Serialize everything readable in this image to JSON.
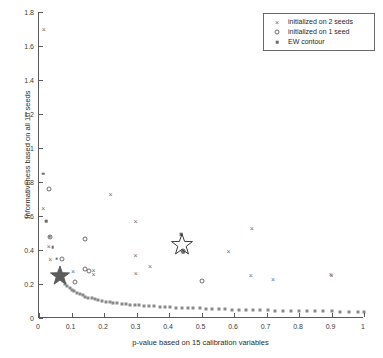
{
  "chart_data": {
    "type": "scatter",
    "title": "",
    "xlabel": "p-value based on 15 calibration variables",
    "ylabel": "Informativeness based on all 10 seeds",
    "xlim": [
      0,
      1
    ],
    "ylim": [
      0,
      1.8
    ],
    "grid": false,
    "legend_position": "top-right",
    "xticks": [
      "0",
      "0.1",
      "0.2",
      "0.3",
      "0.4",
      "0.5",
      "0.6",
      "0.7",
      "0.8",
      "0.9",
      "1"
    ],
    "xtick_values": [
      0,
      0.1,
      0.2,
      0.3,
      0.4,
      0.5,
      0.6,
      0.7,
      0.8,
      0.9,
      1
    ],
    "yticks": [
      "0",
      "0.2",
      "0.4",
      "0.6",
      "0.8",
      "1",
      "1.2",
      "1.4",
      "1.6",
      "1.8"
    ],
    "ytick_values": [
      0,
      0.2,
      0.4,
      0.6,
      0.8,
      1.0,
      1.2,
      1.4,
      1.6,
      1.8
    ],
    "series": [
      {
        "name": "initialized on 2 seeds",
        "marker": "cross",
        "color": "#6e6e6e",
        "points": [
          [
            0.015,
            1.7
          ],
          [
            0.013,
            0.645
          ],
          [
            0.03,
            0.425
          ],
          [
            0.035,
            0.345
          ],
          [
            0.105,
            0.275
          ],
          [
            0.168,
            0.285
          ],
          [
            0.168,
            0.258
          ],
          [
            0.22,
            0.727
          ],
          [
            0.297,
            0.572
          ],
          [
            0.297,
            0.368
          ],
          [
            0.298,
            0.266
          ],
          [
            0.342,
            0.303
          ],
          [
            0.437,
            0.492
          ],
          [
            0.442,
            0.398
          ],
          [
            0.583,
            0.392
          ],
          [
            0.655,
            0.532
          ],
          [
            0.652,
            0.252
          ],
          [
            0.72,
            0.231
          ],
          [
            0.898,
            0.258
          ],
          [
            0.9,
            0.252
          ]
        ]
      },
      {
        "name": "initialized on 1 seed",
        "marker": "circle",
        "color": "#6e6e6e",
        "points": [
          [
            0.032,
            0.76
          ],
          [
            0.035,
            0.478
          ],
          [
            0.072,
            0.348
          ],
          [
            0.11,
            0.211
          ],
          [
            0.143,
            0.462
          ],
          [
            0.143,
            0.288
          ],
          [
            0.155,
            0.277
          ],
          [
            0.5,
            0.219
          ],
          [
            0.443,
            0.392
          ]
        ]
      },
      {
        "name": "EW contour",
        "marker": "dot",
        "color": "#6a6a6a",
        "points": [
          [
            0.013,
            0.85
          ],
          [
            0.023,
            0.57
          ],
          [
            0.033,
            0.478
          ],
          [
            0.042,
            0.415
          ],
          [
            0.055,
            0.348
          ],
          [
            0.06,
            0.268
          ],
          [
            0.437,
            0.492
          ],
          [
            0.443,
            0.388
          ]
        ]
      }
    ],
    "ew_contour_curve": {
      "description": "EW contour decay curve of small square markers",
      "points": [
        [
          0.062,
          0.25
        ],
        [
          0.068,
          0.232
        ],
        [
          0.074,
          0.216
        ],
        [
          0.08,
          0.201
        ],
        [
          0.087,
          0.188
        ],
        [
          0.094,
          0.176
        ],
        [
          0.101,
          0.166
        ],
        [
          0.109,
          0.156
        ],
        [
          0.117,
          0.148
        ],
        [
          0.125,
          0.14
        ],
        [
          0.134,
          0.133
        ],
        [
          0.143,
          0.126
        ],
        [
          0.152,
          0.12
        ],
        [
          0.162,
          0.115
        ],
        [
          0.172,
          0.11
        ],
        [
          0.183,
          0.105
        ],
        [
          0.194,
          0.101
        ],
        [
          0.205,
          0.097
        ],
        [
          0.217,
          0.093
        ],
        [
          0.229,
          0.09
        ],
        [
          0.241,
          0.087
        ],
        [
          0.254,
          0.084
        ],
        [
          0.267,
          0.081
        ],
        [
          0.281,
          0.079
        ],
        [
          0.295,
          0.076
        ],
        [
          0.309,
          0.074
        ],
        [
          0.324,
          0.072
        ],
        [
          0.339,
          0.07
        ],
        [
          0.355,
          0.068
        ],
        [
          0.371,
          0.066
        ],
        [
          0.387,
          0.064
        ],
        [
          0.404,
          0.063
        ],
        [
          0.421,
          0.061
        ],
        [
          0.439,
          0.06
        ],
        [
          0.457,
          0.058
        ],
        [
          0.475,
          0.057
        ],
        [
          0.494,
          0.056
        ],
        [
          0.513,
          0.054
        ],
        [
          0.533,
          0.053
        ],
        [
          0.553,
          0.052
        ],
        [
          0.573,
          0.051
        ],
        [
          0.594,
          0.05
        ],
        [
          0.615,
          0.049
        ],
        [
          0.637,
          0.048
        ],
        [
          0.659,
          0.047
        ],
        [
          0.681,
          0.046
        ],
        [
          0.704,
          0.045
        ],
        [
          0.727,
          0.044
        ],
        [
          0.751,
          0.043
        ],
        [
          0.775,
          0.043
        ],
        [
          0.799,
          0.042
        ],
        [
          0.824,
          0.041
        ],
        [
          0.849,
          0.04
        ],
        [
          0.875,
          0.039
        ],
        [
          0.901,
          0.039
        ],
        [
          0.927,
          0.038
        ],
        [
          0.954,
          0.037
        ],
        [
          0.981,
          0.036
        ],
        [
          1.0,
          0.036
        ]
      ]
    },
    "annotations": [
      {
        "name": "filled-star",
        "shape": "star-filled",
        "x": 0.065,
        "y": 0.25,
        "color": "#5c5c5c",
        "size": 20
      },
      {
        "name": "hollow-star",
        "shape": "star-outline",
        "x": 0.44,
        "y": 0.432,
        "color": "#3a3a3a",
        "size": 22
      }
    ]
  },
  "legend": {
    "entries": [
      {
        "label": "initialized on 2 seeds",
        "marker": "cross"
      },
      {
        "label": "initialized on 1 seed",
        "marker": "circle"
      },
      {
        "label": "EW contour",
        "marker": "dot"
      }
    ]
  }
}
